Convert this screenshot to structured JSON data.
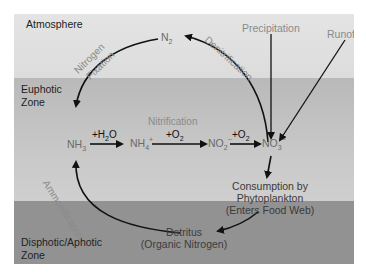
{
  "zones": {
    "atmosphere": "Atmosphere",
    "euphotic_line1": "Euphotic",
    "euphotic_line2": "Zone",
    "disphotic_line1": "Disphotic/Aphotic",
    "disphotic_line2": "Zone"
  },
  "nodes": {
    "n2": {
      "base": "N",
      "sub": "2"
    },
    "nh3": {
      "base": "NH",
      "sub": "3"
    },
    "nh4": {
      "base": "NH",
      "sub": "4",
      "sup": "+"
    },
    "no2": {
      "base": "NO",
      "sub": "2",
      "sup": "−"
    },
    "no3": {
      "base": "NO",
      "sub": "3",
      "sup": "−"
    },
    "consumption_line1": "Consumption by",
    "consumption_line2": "Phytoplankton",
    "consumption_line3": "(Enters Food Web)",
    "detritus_line1": "Detritus",
    "detritus_line2": "(Organic Nitrogen)"
  },
  "processes": {
    "nitrogen_fixation_line1": "Nitrogen",
    "nitrogen_fixation_line2": "Fixation",
    "denitrification": "Denitrification",
    "nitrification": "Nitrification",
    "ammonification": "Ammonification",
    "precipitation": "Precipitation",
    "runoff": "Runoff"
  },
  "conditions": {
    "h2o": {
      "prefix": "+H",
      "sub": "2",
      "suffix": "O"
    },
    "o2_a": {
      "prefix": "+O",
      "sub": "2"
    },
    "o2_b": {
      "prefix": "+O",
      "sub": "2"
    }
  },
  "colors": {
    "atmosphere": "#e0e0e0",
    "euphotic": "#c4c4c4",
    "disphotic": "#929292",
    "arrow": "#111111",
    "process_text": "#8a8a8a"
  }
}
